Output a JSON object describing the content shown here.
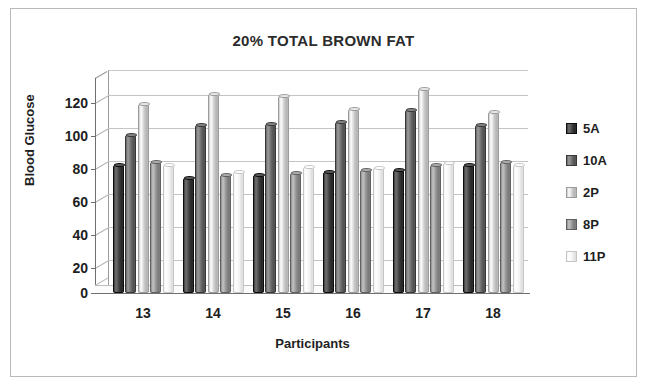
{
  "chart_data": {
    "type": "bar",
    "title": "20% TOTAL BROWN FAT",
    "xlabel": "Participants",
    "ylabel": "Blood Glucose",
    "categories": [
      "13",
      "14",
      "15",
      "16",
      "17",
      "18"
    ],
    "ylim": [
      0,
      130
    ],
    "yticks": [
      0,
      20,
      40,
      60,
      80,
      100,
      120
    ],
    "ytick_labels": [
      "0",
      "20",
      "40",
      "60",
      "80",
      "100",
      "120"
    ],
    "grid": true,
    "legend_position": "right",
    "style": "3d-cylinder",
    "series": [
      {
        "name": "5A",
        "color": "#3a3a3a",
        "values": [
          78,
          70,
          72,
          74,
          75,
          78
        ]
      },
      {
        "name": "10A",
        "color": "#656565",
        "values": [
          96,
          102,
          103,
          104,
          111,
          102
        ]
      },
      {
        "name": "2P",
        "color": "#c8c8c8",
        "values": [
          115,
          121,
          120,
          112,
          124,
          110
        ]
      },
      {
        "name": "8P",
        "color": "#8d8d8d",
        "values": [
          80,
          72,
          73,
          75,
          78,
          80
        ]
      },
      {
        "name": "11P",
        "color": "#f2f2f2",
        "values": [
          78,
          74,
          77,
          76,
          79,
          78
        ]
      }
    ]
  },
  "colors": {
    "axis": "#6f6f6f",
    "grid": "#c4c4c4",
    "text": "#1e1e1e",
    "title": "#2b2b2b",
    "frame": "#b9b9b9",
    "background": "#ffffff"
  }
}
